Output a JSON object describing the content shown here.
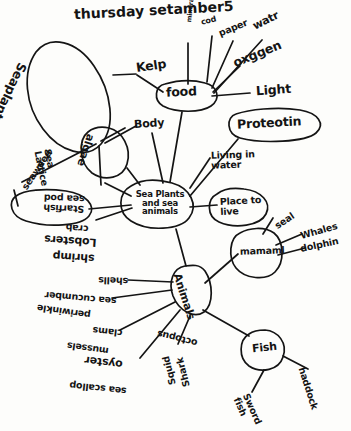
{
  "page": {
    "title_note": "thursday setamber5",
    "center_node": "Sea Plants\nand sea\nanimals"
  },
  "nodes": {
    "seaplants": "Seaplants",
    "food": "food",
    "algae": "algae",
    "starfish_group": "Starfish\nsea pod",
    "place_to_live": "Place to\nlive",
    "proteotin": "Proteotin",
    "mammal": "mamaml",
    "animals": "Animals",
    "fish": "Fish"
  },
  "labels": {
    "kelp": "Kelp",
    "minerals": "minerals",
    "cod": "cod",
    "paper": "paper",
    "water": "watr",
    "oxygen": "oxggen",
    "light": "Light",
    "body": "Body",
    "living_in_water": "Living in\nwater",
    "seaweed": "seaweed",
    "sea_lattice": "Sea\nLattice",
    "crab": "crab",
    "lobsters": "Lobsters",
    "shrimp": "shrimp",
    "seal": "seal",
    "whales": "Whales",
    "dolphin": "dolphin",
    "shells": "shells",
    "sea_cucumber": "sea cucumber",
    "periwinkle": "periwinkle",
    "clams": "clams",
    "mussels": "mussels",
    "oyster": "oyster",
    "sea_scallop": "sea scallop",
    "squid": "Squid",
    "shark": "Shark",
    "octopus": "octopus",
    "haddock": "haddock",
    "sword_fish": "Sword\nfish"
  },
  "colors": {
    "ink": "#141414",
    "paper": "#fdfdfb"
  }
}
